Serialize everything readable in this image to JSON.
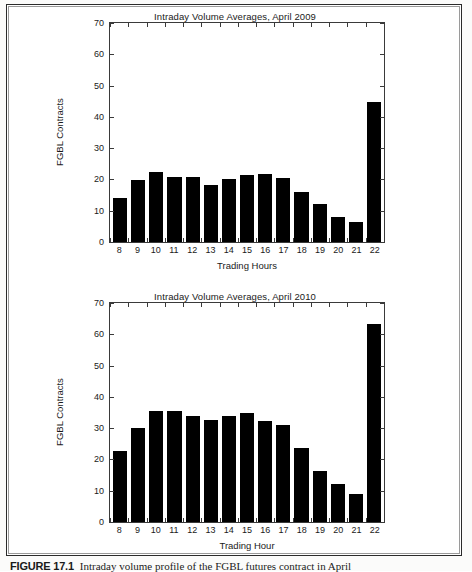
{
  "figure": {
    "caption_number": "FIGURE 17.1",
    "caption_text": "Intraday volume profile of the FGBL futures contract in April"
  },
  "charts": [
    {
      "id": "chart-2009",
      "title": "Intraday Volume Averages, April 2009",
      "xlabel": "Trading Hours",
      "ylabel": "FGBL Contracts",
      "yticks": [
        "0",
        "10",
        "20",
        "30",
        "40",
        "50",
        "60",
        "70"
      ],
      "categories": [
        "8",
        "9",
        "10",
        "11",
        "12",
        "13",
        "14",
        "15",
        "16",
        "17",
        "18",
        "19",
        "20",
        "21",
        "22"
      ]
    },
    {
      "id": "chart-2010",
      "title": "Intraday Volume Averages, April 2010",
      "xlabel": "Trading Hour",
      "ylabel": "FGBL Contracts",
      "yticks": [
        "0",
        "10",
        "20",
        "30",
        "40",
        "50",
        "60",
        "70"
      ],
      "categories": [
        "8",
        "9",
        "10",
        "11",
        "12",
        "13",
        "14",
        "15",
        "16",
        "17",
        "18",
        "19",
        "20",
        "21",
        "22"
      ]
    }
  ],
  "chart_data": [
    {
      "type": "bar",
      "title": "Intraday Volume Averages, April 2009",
      "xlabel": "Trading Hours",
      "ylabel": "FGBL Contracts",
      "ylim": [
        0,
        70
      ],
      "ytick_step": 10,
      "grid": false,
      "legend": null,
      "bar_color": "#000000",
      "categories": [
        "8",
        "9",
        "10",
        "11",
        "12",
        "13",
        "14",
        "15",
        "16",
        "17",
        "18",
        "19",
        "20",
        "21",
        "22"
      ],
      "values": [
        14.2,
        19.7,
        22.5,
        20.7,
        20.9,
        18.1,
        20.0,
        21.5,
        21.7,
        20.6,
        15.9,
        12.0,
        7.9,
        6.5,
        44.8
      ]
    },
    {
      "type": "bar",
      "title": "Intraday Volume Averages, April 2010",
      "xlabel": "Trading Hour",
      "ylabel": "FGBL Contracts",
      "ylim": [
        0,
        70
      ],
      "ytick_step": 10,
      "grid": false,
      "legend": null,
      "bar_color": "#000000",
      "categories": [
        "8",
        "9",
        "10",
        "11",
        "12",
        "13",
        "14",
        "15",
        "16",
        "17",
        "18",
        "19",
        "20",
        "21",
        "22"
      ],
      "values": [
        22.8,
        30.2,
        35.4,
        35.5,
        33.8,
        32.5,
        34.0,
        35.0,
        32.2,
        31.0,
        23.8,
        16.2,
        12.3,
        8.8,
        63.2
      ]
    }
  ]
}
